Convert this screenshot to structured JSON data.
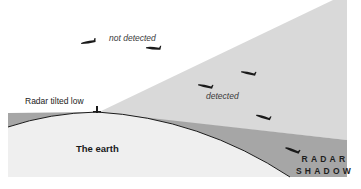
{
  "labels": {
    "not_detected": "not detected",
    "detected": "detected",
    "radar": "Radar tilted low",
    "earth": "The earth",
    "shadow_line1": "RADAR",
    "shadow_line2": "SHADOW"
  },
  "aircraft_count": 6,
  "colors": {
    "background": "#ffffff",
    "beam": "#d9d9d9",
    "shadow": "#a6a6a6",
    "earth": "#efefef",
    "earth_outline": "#1a1a1a",
    "aircraft": "#1a1a1a"
  }
}
